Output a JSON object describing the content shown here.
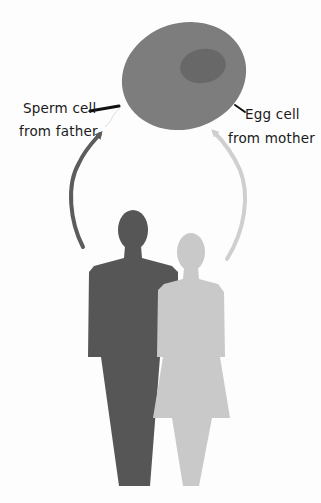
{
  "diagram": {
    "labels": {
      "sperm_line1": "Sperm cell",
      "sperm_line2": "from father",
      "egg_line1": "Egg cell",
      "egg_line2": "from mother"
    },
    "colors": {
      "cell": "#7d7d7d",
      "nucleus": "#686868",
      "father": "#565656",
      "mother": "#c9c9c9",
      "father_arrow": "#5c5c5c",
      "mother_arrow": "#cfcfcf",
      "pointer": "#111111"
    },
    "elements": [
      "egg-cell",
      "nucleus",
      "sperm-cell",
      "father-silhouette",
      "mother-silhouette",
      "father-arrow",
      "mother-arrow"
    ]
  }
}
